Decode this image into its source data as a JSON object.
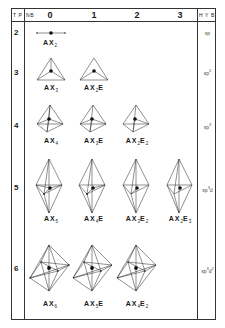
{
  "header": {
    "tp_label": "T P",
    "nb_label": "NB",
    "hyb_label": "H Y B",
    "columns": [
      "0",
      "1",
      "2",
      "3"
    ]
  },
  "rows": [
    {
      "tp": "2",
      "hyb_base": "sp",
      "hyb_sup": "",
      "hyb_tail": "",
      "hyb_sup2": "",
      "formulas": [
        {
          "a": "AX",
          "x": "2",
          "e": "",
          "en": ""
        }
      ]
    },
    {
      "tp": "3",
      "hyb_base": "sp",
      "hyb_sup": "2",
      "hyb_tail": "",
      "hyb_sup2": "",
      "formulas": [
        {
          "a": "AX",
          "x": "3",
          "e": "",
          "en": ""
        },
        {
          "a": "AX",
          "x": "2",
          "e": "E",
          "en": ""
        }
      ]
    },
    {
      "tp": "4",
      "hyb_base": "sp",
      "hyb_sup": "3",
      "hyb_tail": "",
      "hyb_sup2": "",
      "formulas": [
        {
          "a": "AX",
          "x": "4",
          "e": "",
          "en": ""
        },
        {
          "a": "AX",
          "x": "3",
          "e": "E",
          "en": ""
        },
        {
          "a": "AX",
          "x": "2",
          "e": "E",
          "en": "2"
        }
      ]
    },
    {
      "tp": "5",
      "hyb_base": "sp",
      "hyb_sup": "3",
      "hyb_tail": "d",
      "hyb_sup2": "",
      "formulas": [
        {
          "a": "AX",
          "x": "5",
          "e": "",
          "en": ""
        },
        {
          "a": "AX",
          "x": "4",
          "e": "E",
          "en": ""
        },
        {
          "a": "AX",
          "x": "3",
          "e": "E",
          "en": "2"
        },
        {
          "a": "AX",
          "x": "2",
          "e": "E",
          "en": "3"
        }
      ]
    },
    {
      "tp": "6",
      "hyb_base": "sp",
      "hyb_sup": "3",
      "hyb_tail": "d",
      "hyb_sup2": "2",
      "formulas": [
        {
          "a": "AX",
          "x": "6",
          "e": "",
          "en": ""
        },
        {
          "a": "AX",
          "x": "5",
          "e": "E",
          "en": ""
        },
        {
          "a": "AX",
          "x": "4",
          "e": "E",
          "en": "2"
        }
      ]
    }
  ],
  "geometries": {
    "row2": "linear",
    "row3": "trigonal-planar",
    "row4": "tetrahedral",
    "row5": "trigonal-bipyramidal",
    "row6": "octahedral"
  }
}
